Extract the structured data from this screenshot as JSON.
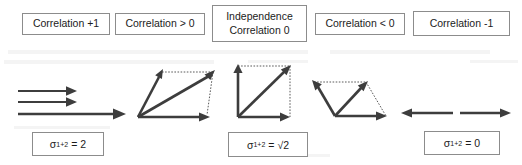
{
  "figure": {
    "background_color": "#ffffff",
    "stroke_color": "#3d3d3d",
    "box_border_color": "#8c8c8c"
  },
  "top_labels": [
    {
      "id": "correlation-plus-one",
      "line1": "Correlation +1",
      "line2": ""
    },
    {
      "id": "correlation-greater-zero",
      "line1": "Correlation > 0",
      "line2": ""
    },
    {
      "id": "independence",
      "line1": "Independence",
      "line2": "Correlation 0"
    },
    {
      "id": "correlation-less-zero",
      "line1": "Correlation < 0",
      "line2": ""
    },
    {
      "id": "correlation-minus-one",
      "line1": "Correlation -1",
      "line2": ""
    }
  ],
  "sigma_labels": [
    {
      "id": "sigma-equals-2",
      "symbol": "σ",
      "subscript": "1+2",
      "equals": "=",
      "value": "2"
    },
    {
      "id": "sigma-equals-sqrt2",
      "symbol": "σ",
      "subscript": "1+2",
      "equals": "=",
      "value": "√2"
    },
    {
      "id": "sigma-equals-0",
      "symbol": "σ",
      "subscript": "1+2",
      "equals": "=",
      "value": "0"
    }
  ],
  "diagrams": [
    {
      "id": "collinear-same-direction",
      "description": "Three parallel horizontal arrows pointing right; two short equal vectors stacked above one long resultant vector of double length",
      "vectors": [
        {
          "name": "vector-1",
          "angle_deg": 0,
          "length_rel": 1
        },
        {
          "name": "vector-2",
          "angle_deg": 0,
          "length_rel": 1
        },
        {
          "name": "resultant",
          "angle_deg": 0,
          "length_rel": 2
        }
      ]
    },
    {
      "id": "acute-parallelogram",
      "description": "Parallelogram addition with an acute angle between the two component vectors; resultant is the long diagonal",
      "vectors": [
        {
          "name": "vector-1",
          "angle_deg": 62,
          "length_rel": 1
        },
        {
          "name": "vector-2",
          "angle_deg": 0,
          "length_rel": 1
        },
        {
          "name": "resultant",
          "angle_deg": 31,
          "length_rel": 1.7
        }
      ]
    },
    {
      "id": "right-angle-square",
      "description": "Right-angle (orthogonal) addition; the two vectors form a square and the resultant is its diagonal of length root two",
      "vectors": [
        {
          "name": "vector-1",
          "angle_deg": 90,
          "length_rel": 1
        },
        {
          "name": "vector-2",
          "angle_deg": 0,
          "length_rel": 1
        },
        {
          "name": "resultant",
          "angle_deg": 45,
          "length_rel": 1.414
        }
      ]
    },
    {
      "id": "obtuse-parallelogram",
      "description": "Parallelogram addition with an obtuse angle between the components; resultant is a short horizontal vector",
      "vectors": [
        {
          "name": "vector-1",
          "angle_deg": 125,
          "length_rel": 1
        },
        {
          "name": "vector-2",
          "angle_deg": 55,
          "length_rel": 1
        },
        {
          "name": "resultant",
          "angle_deg": 0,
          "length_rel": 1.15
        }
      ]
    },
    {
      "id": "anti-collinear",
      "description": "Two equal and opposite horizontal arrows; one points left and one points right, so the resultant is zero",
      "vectors": [
        {
          "name": "vector-1",
          "angle_deg": 180,
          "length_rel": 1
        },
        {
          "name": "vector-2",
          "angle_deg": 0,
          "length_rel": 1
        }
      ]
    }
  ]
}
